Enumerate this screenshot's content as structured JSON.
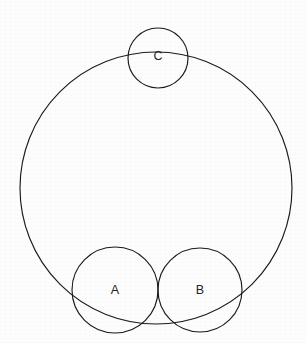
{
  "figure": {
    "canvas": {
      "width": 306,
      "height": 343
    },
    "background_color": "#fdfdfd",
    "stroke_color": "#1a1a1a",
    "label_color": "#242424",
    "stroke_width": 1.15,
    "shapes": [
      {
        "id": "large",
        "role": "enclosing-circle",
        "label": "",
        "cx": 156,
        "cy": 188,
        "r": 136
      },
      {
        "id": "c",
        "role": "small-circle-top",
        "label": "C",
        "cx": 158,
        "cy": 58,
        "r": 30,
        "label_x": 158,
        "label_y": 57
      },
      {
        "id": "a",
        "role": "small-circle-bottom-left",
        "label": "A",
        "cx": 115,
        "cy": 290,
        "r": 43,
        "label_x": 115,
        "label_y": 291
      },
      {
        "id": "b",
        "role": "small-circle-bottom-right",
        "label": "B",
        "cx": 200,
        "cy": 290,
        "r": 42,
        "label_x": 200,
        "label_y": 291
      }
    ]
  }
}
